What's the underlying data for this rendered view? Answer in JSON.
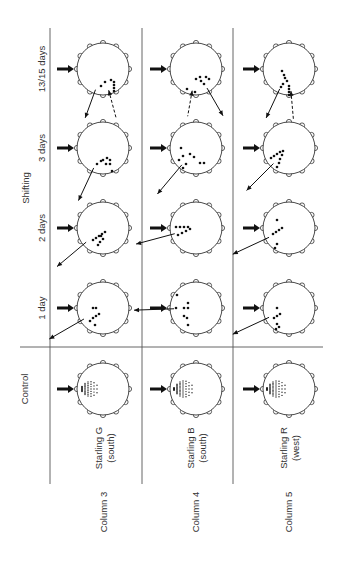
{
  "figure": {
    "row_group_label": "Shifting",
    "rows": [
      {
        "key": "d13",
        "label": "13/15 days",
        "y": 69,
        "label_y": 69
      },
      {
        "key": "d3",
        "label": "3 days",
        "y": 148,
        "label_y": 148
      },
      {
        "key": "d2",
        "label": "2 days",
        "y": 228,
        "label_y": 228
      },
      {
        "key": "d1",
        "label": "1 day",
        "y": 308,
        "label_y": 308
      },
      {
        "key": "ctrl",
        "label": "Control",
        "y": 389,
        "label_y": 389
      }
    ],
    "columns": [
      {
        "key": "c3",
        "label": "Column 3",
        "bird": "Starling G",
        "direction": "(south)",
        "x": 103
      },
      {
        "key": "c4",
        "label": "Column 4",
        "bird": "Starling B",
        "direction": "(south)",
        "x": 196
      },
      {
        "key": "c5",
        "label": "Column 5",
        "bird": "Starling R",
        "direction": "(west)",
        "x": 289
      }
    ],
    "circle_radius": 26,
    "feeder_count": 12,
    "cells": {
      "c3": {
        "d13": {
          "dots": [
            [
              2,
              13
            ],
            [
              8,
              11
            ],
            [
              11,
              13
            ],
            [
              11,
              16
            ],
            [
              11,
              19
            ],
            [
              11,
              22
            ],
            [
              -2,
              17
            ]
          ],
          "arrows": [
            {
              "type": "thin",
              "angle": -110,
              "len": 30
            },
            {
              "type": "dash",
              "angle": -75,
              "len": 28,
              "inward": true
            }
          ]
        },
        "d3": {
          "dots": [
            [
              -6,
              16
            ],
            [
              -2,
              13
            ],
            [
              0,
              12
            ],
            [
              4,
              10
            ],
            [
              7,
              12
            ],
            [
              7,
              16
            ],
            [
              3,
              16
            ],
            [
              9,
              23
            ]
          ],
          "arrows": [
            {
              "type": "thin",
              "angle": -115,
              "len": 36
            }
          ]
        },
        "d2": {
          "dots": [
            [
              -10,
              12
            ],
            [
              -7,
              10
            ],
            [
              -4,
              8
            ],
            [
              -1,
              6
            ],
            [
              2,
              4
            ],
            [
              -2,
              8
            ],
            [
              0,
              11
            ],
            [
              -3,
              14
            ],
            [
              -5,
              17
            ]
          ],
          "arrows": [
            {
              "type": "thin",
              "angle": -140,
              "len": 38
            }
          ]
        },
        "d1": {
          "dots": [
            [
              -10,
              0
            ],
            [
              -7,
              0
            ],
            [
              -13,
              13
            ],
            [
              -10,
              10
            ],
            [
              -7,
              8
            ],
            [
              -4,
              6
            ],
            [
              -8,
              17
            ]
          ],
          "arrows": [
            {
              "type": "thin",
              "angle": -150,
              "len": 40
            }
          ]
        }
      },
      "c4": {
        "d13": {
          "dots": [
            [
              -9,
              20
            ],
            [
              0,
              10
            ],
            [
              4,
              8
            ],
            [
              5,
              12
            ],
            [
              8,
              15
            ],
            [
              10,
              8
            ],
            [
              13,
              10
            ],
            [
              -1,
              23
            ]
          ],
          "arrows": [
            {
              "type": "dash",
              "angle": -100,
              "len": 26,
              "inward": true
            },
            {
              "type": "thin",
              "angle": -60,
              "len": 32
            }
          ]
        },
        "d3": {
          "dots": [
            [
              -15,
              0
            ],
            [
              -13,
              8
            ],
            [
              -17,
              12
            ],
            [
              -10,
              16
            ],
            [
              -6,
              6
            ],
            [
              -2,
              9
            ],
            [
              4,
              15
            ],
            [
              8,
              15
            ],
            [
              -13,
              20
            ]
          ],
          "arrows": [
            {
              "type": "thin",
              "angle": -130,
              "len": 38
            }
          ]
        },
        "d2": {
          "dots": [
            [
              -20,
              -1
            ],
            [
              -16,
              -1
            ],
            [
              -12,
              -1
            ],
            [
              -8,
              -1
            ],
            [
              -18,
              7
            ],
            [
              -14,
              5
            ],
            [
              -10,
              3
            ],
            [
              -6,
              1
            ]
          ],
          "arrows": [
            {
              "type": "thin",
              "angle": -165,
              "len": 40
            }
          ]
        },
        "d1": {
          "dots": [
            [
              -19,
              -13
            ],
            [
              -20,
              0
            ],
            [
              -12,
              0
            ],
            [
              -8,
              -5
            ],
            [
              -8,
              0
            ],
            [
              -12,
              8
            ],
            [
              -9,
              10
            ],
            [
              -8,
              17
            ]
          ],
          "arrows": [
            {
              "type": "thin",
              "angle": -178,
              "len": 40
            }
          ]
        }
      },
      "c5": {
        "d13": {
          "dots": [
            [
              -7,
              2
            ],
            [
              -5,
              6
            ],
            [
              -4,
              9
            ],
            [
              -2,
              12
            ],
            [
              -6,
              15
            ],
            [
              -8,
              18
            ],
            [
              0,
              17
            ],
            [
              0,
              20
            ],
            [
              0,
              23
            ],
            [
              0,
              26
            ]
          ],
          "arrows": [
            {
              "type": "thin",
              "angle": -115,
              "len": 32
            },
            {
              "type": "dash",
              "angle": -85,
              "len": 28,
              "inward": true
            }
          ]
        },
        "d3": {
          "dots": [
            [
              -18,
              10
            ],
            [
              -15,
              8
            ],
            [
              -12,
              6
            ],
            [
              -9,
              4
            ],
            [
              -6,
              3
            ],
            [
              -7,
              7
            ],
            [
              -9,
              11
            ],
            [
              -10,
              15
            ],
            [
              -12,
              19
            ]
          ],
          "arrows": [
            {
              "type": "thin",
              "angle": -135,
              "len": 38
            }
          ]
        },
        "d2": {
          "dots": [
            [
              -12,
              -8
            ],
            [
              -16,
              6
            ],
            [
              -13,
              4
            ],
            [
              -10,
              2
            ],
            [
              -7,
              0
            ],
            [
              -12,
              16
            ],
            [
              -14,
              20
            ]
          ],
          "arrows": [
            {
              "type": "thin",
              "angle": -155,
              "len": 40
            }
          ]
        },
        "d1": {
          "dots": [
            [
              -12,
              0
            ],
            [
              -15,
              10
            ],
            [
              -12,
              8
            ],
            [
              -9,
              6
            ],
            [
              -12,
              16
            ],
            [
              -10,
              19
            ],
            [
              -13,
              21
            ]
          ],
          "arrows": [
            {
              "type": "thin",
              "angle": -155,
              "len": 40
            }
          ]
        }
      }
    },
    "control_spread": {
      "c3": 20,
      "c4": 22,
      "c5": 22
    },
    "colors": {
      "ink": "#111111",
      "grid": "#555555",
      "paper": "#ffffff"
    }
  }
}
